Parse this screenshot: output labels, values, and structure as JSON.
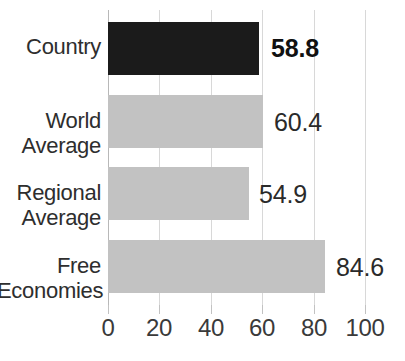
{
  "chart_data": {
    "type": "bar",
    "orientation": "horizontal",
    "title": "",
    "subtitle": "",
    "xlabel": "",
    "ylabel": "",
    "xlim": [
      0,
      100
    ],
    "grid": true,
    "legend": false,
    "categories": [
      "Country",
      "World Average",
      "Regional Average",
      "Free Economies"
    ],
    "values": [
      58.8,
      60.4,
      54.9,
      84.6
    ],
    "value_labels": [
      "58.8",
      "60.4",
      "54.9",
      "84.6"
    ],
    "highlight_index": 0,
    "xticks": [
      0,
      20,
      40,
      60,
      80,
      100
    ],
    "xtick_labels": [
      "0",
      "20",
      "40",
      "60",
      "80",
      "100"
    ],
    "bar_colors": [
      "#1b1b1b",
      "#c2c2c2",
      "#c2c2c2",
      "#c2c2c2"
    ],
    "colors": {
      "highlight_bar": "#1b1b1b",
      "normal_bar": "#c2c2c2",
      "gridline": "#d8d8d8",
      "axis": "#b8b8b8",
      "text": "#2e2e2e",
      "background": "#ffffff"
    }
  },
  "categories": {
    "country": {
      "line1": "Country",
      "line2": ""
    },
    "world": {
      "line1": "World",
      "line2": "Average"
    },
    "regional": {
      "line1": "Regional",
      "line2": "Average"
    },
    "free": {
      "line1": "Free",
      "line2": "Economies"
    }
  },
  "values": {
    "country": "58.8",
    "world": "60.4",
    "regional": "54.9",
    "free": "84.6"
  },
  "axis": {
    "tick0": "0",
    "tick20": "20",
    "tick40": "40",
    "tick60": "60",
    "tick80": "80",
    "tick100": "100"
  }
}
